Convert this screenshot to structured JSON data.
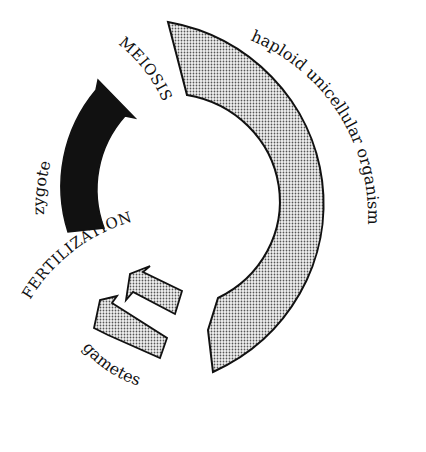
{
  "diagram": {
    "type": "life-cycle",
    "title": "",
    "labels": {
      "meiosis": "MEIOSIS",
      "haploid": "haploid unicellular organism",
      "zygote": "zygote",
      "fertilization": "FERTILIZATION",
      "gametes": "gametes"
    },
    "stages": [
      {
        "name": "zygote",
        "fill": "black",
        "shape": "curved arrow"
      },
      {
        "name": "haploid unicellular organism",
        "fill": "stippled",
        "shape": "large curved arrow"
      },
      {
        "name": "gametes",
        "fill": "stippled",
        "shape": "two small curved arrows"
      }
    ],
    "transitions": [
      "MEIOSIS",
      "FERTILIZATION"
    ],
    "colors": {
      "dark": "#111111",
      "stipple": "#b8b8b8",
      "background": "#ffffff"
    }
  }
}
